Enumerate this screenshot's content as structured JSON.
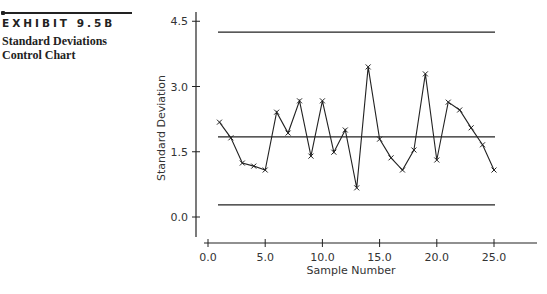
{
  "header": {
    "exhibit_label": "EXHIBIT 9.5B",
    "subtitle_line1": "Standard Deviations",
    "subtitle_line2": "Control Chart"
  },
  "chart_data": {
    "type": "line",
    "title": "Standard Deviations Control Chart",
    "xlabel": "Sample Number",
    "ylabel": "Standard Deviation",
    "x_ticks": [
      "0.0",
      "5.0",
      "10.0",
      "15.0",
      "20.0",
      "25.0"
    ],
    "y_ticks": [
      "0.0",
      "1.5",
      "3.0",
      "4.5"
    ],
    "xlim": [
      0,
      29
    ],
    "ylim": [
      -0.4,
      4.7
    ],
    "grid": false,
    "legend": "none",
    "marker": "x",
    "x": [
      1,
      2,
      3,
      4,
      5,
      6,
      7,
      8,
      9,
      10,
      11,
      12,
      13,
      14,
      15,
      16,
      17,
      18,
      19,
      20,
      21,
      22,
      23,
      24,
      25
    ],
    "series": [
      {
        "name": "Sample Standard Deviation",
        "values": [
          2.18,
          1.82,
          1.24,
          1.17,
          1.08,
          2.41,
          1.93,
          2.67,
          1.4,
          2.67,
          1.49,
          2.0,
          0.67,
          3.45,
          1.79,
          1.36,
          1.08,
          1.54,
          3.29,
          1.31,
          2.64,
          2.46,
          2.05,
          1.66,
          1.08
        ]
      }
    ],
    "control_lines": {
      "UCL": 4.25,
      "center_line": 1.84,
      "LCL": 0.28
    }
  }
}
